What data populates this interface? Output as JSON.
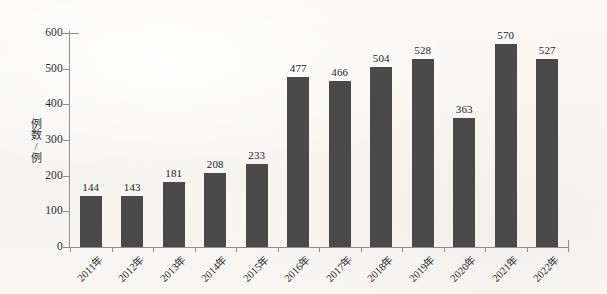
{
  "chart_data": {
    "type": "bar",
    "title": "",
    "xlabel": "",
    "ylabel": "例数/例",
    "categories": [
      "2011年",
      "2012年",
      "2013年",
      "2014年",
      "2015年",
      "2016年",
      "2017年",
      "2018年",
      "2019年",
      "2020年",
      "2021年",
      "2022年"
    ],
    "values": [
      144,
      143,
      181,
      208,
      233,
      477,
      466,
      504,
      528,
      363,
      570,
      527
    ],
    "ylim": [
      0,
      600
    ],
    "yticks": [
      "0",
      "100",
      "200",
      "300",
      "400",
      "500",
      "600"
    ],
    "grid": false,
    "legend": null,
    "bar_color": "#4a4a4a",
    "background_color": "#f8f7f5",
    "axis_color": "#8d8d8d",
    "text_color": "#1f1f1f"
  }
}
